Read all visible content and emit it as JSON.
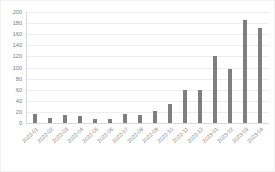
{
  "chart_data": {
    "type": "bar",
    "title": "",
    "subtitle": "",
    "xlabel": "",
    "ylabel": "",
    "ylim": [
      0,
      200
    ],
    "ytick_step": 20,
    "grid": true,
    "legend": false,
    "bar_color": "#7f7f7f",
    "gridline_color": "#ededed",
    "axis_color": "#d9d9d9",
    "label_color": "#7b7b7b",
    "yticks": [
      "200",
      "180",
      "160",
      "140",
      "120",
      "100",
      "80",
      "60",
      "40",
      "20",
      "0"
    ],
    "ytick_values": [
      200,
      180,
      160,
      140,
      120,
      100,
      80,
      60,
      40,
      20,
      0
    ],
    "categories": [
      "2022-01",
      "2022-02",
      "2022-03",
      "2022-04",
      "2022-05",
      "2022-06",
      "2022-07",
      "2022-08",
      "2022-09",
      "2022-10",
      "2022-11",
      "2022-12",
      "2023-01",
      "2023-02",
      "2023-03",
      "2023-04"
    ],
    "values": [
      16,
      9,
      14,
      13,
      8,
      7,
      17,
      15,
      21,
      35,
      60,
      60,
      120,
      98,
      185,
      172
    ],
    "series": [
      {
        "name": "count",
        "values": [
          16,
          9,
          14,
          13,
          8,
          7,
          17,
          15,
          21,
          35,
          60,
          60,
          120,
          98,
          185,
          172
        ]
      }
    ]
  }
}
